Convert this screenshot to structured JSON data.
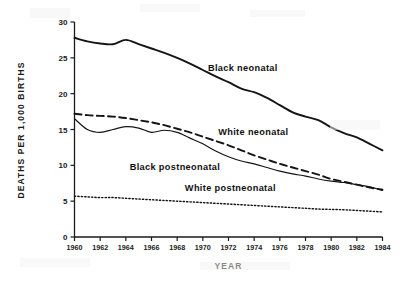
{
  "chart_data": {
    "type": "line",
    "title": "",
    "xlabel": "YEAR",
    "ylabel": "DEATHS PER 1,000 BIRTHS",
    "xlim": [
      1960,
      1984
    ],
    "ylim": [
      0,
      30
    ],
    "xticks": [
      1960,
      1962,
      1964,
      1966,
      1968,
      1970,
      1972,
      1974,
      1976,
      1978,
      1980,
      1982,
      1984
    ],
    "xtick_labels": [
      "1960",
      "1962",
      "1964",
      "1966",
      "1968",
      "1970",
      "1972",
      "1974",
      "1976",
      "1978",
      "1980",
      "1982",
      "1984"
    ],
    "yticks": [
      0,
      5,
      10,
      15,
      20,
      25,
      30
    ],
    "ytick_labels": [
      "0",
      "5",
      "10",
      "15",
      "20",
      "25",
      "30"
    ],
    "grid": false,
    "legend": "inline-annotations",
    "x": [
      1960,
      1961,
      1962,
      1963,
      1964,
      1965,
      1966,
      1967,
      1968,
      1969,
      1970,
      1971,
      1972,
      1973,
      1974,
      1975,
      1976,
      1977,
      1978,
      1979,
      1980,
      1981,
      1982,
      1983,
      1984
    ],
    "series": [
      {
        "name": "Black neonatal",
        "style": "solid-thick",
        "color": "#141414",
        "label_x": 1970.4,
        "label_y": 23.2,
        "values": [
          27.8,
          27.3,
          27.0,
          26.9,
          27.5,
          26.9,
          26.3,
          25.7,
          25.0,
          24.2,
          23.3,
          22.4,
          21.6,
          20.7,
          20.2,
          19.4,
          18.4,
          17.4,
          16.8,
          16.3,
          15.3,
          14.5,
          13.9,
          13.0,
          12.1
        ]
      },
      {
        "name": "White neonatal",
        "style": "dashed",
        "color": "#141414",
        "label_x": 1971.2,
        "label_y": 14.3,
        "values": [
          17.2,
          17.0,
          16.9,
          16.8,
          16.6,
          16.3,
          16.0,
          15.6,
          15.1,
          14.6,
          14.0,
          13.4,
          12.8,
          12.1,
          11.4,
          10.8,
          10.2,
          9.7,
          9.2,
          8.7,
          8.1,
          7.7,
          7.3,
          6.9,
          6.6
        ]
      },
      {
        "name": "Black postneonatal",
        "style": "dotted-fine",
        "color": "#141414",
        "label_x": 1964.3,
        "label_y": 9.3,
        "values": [
          16.5,
          15.0,
          14.6,
          15.0,
          15.4,
          15.2,
          14.6,
          14.9,
          14.6,
          13.8,
          13.0,
          12.0,
          11.2,
          10.6,
          10.2,
          9.7,
          9.2,
          8.8,
          8.5,
          8.1,
          7.8,
          7.6,
          7.3,
          7.0,
          6.5
        ]
      },
      {
        "name": "White postneonatal",
        "style": "dotted-sparse",
        "color": "#141414",
        "label_x": 1968.6,
        "label_y": 6.4,
        "values": [
          5.7,
          5.6,
          5.5,
          5.5,
          5.4,
          5.3,
          5.2,
          5.1,
          5.0,
          4.9,
          4.8,
          4.7,
          4.6,
          4.5,
          4.4,
          4.3,
          4.2,
          4.1,
          4.0,
          3.9,
          3.85,
          3.8,
          3.7,
          3.6,
          3.5
        ]
      }
    ]
  }
}
